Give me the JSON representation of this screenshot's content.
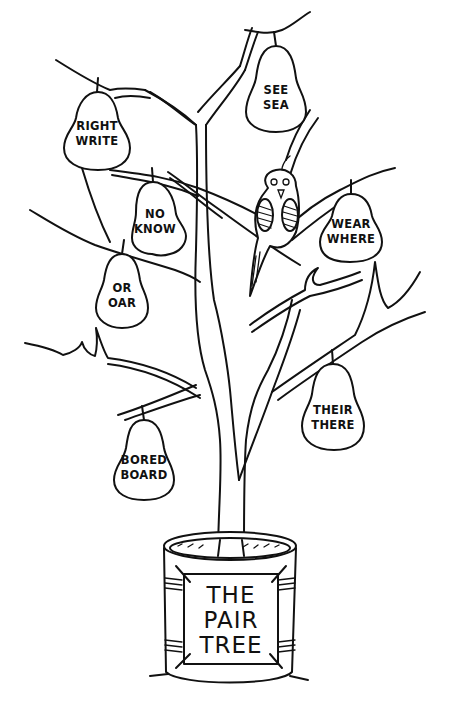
{
  "illustration": {
    "title": "THE PAIR TREE",
    "sign": {
      "lines": [
        "THE",
        "PAIR",
        "TREE"
      ]
    },
    "pears": [
      {
        "id": "right-write",
        "words": [
          "RIGHT",
          "WRITE"
        ]
      },
      {
        "id": "see-sea",
        "words": [
          "SEE",
          "SEA"
        ]
      },
      {
        "id": "no-know",
        "words": [
          "NO",
          "KNOW"
        ]
      },
      {
        "id": "wear-where",
        "words": [
          "WEAR",
          "WHERE"
        ]
      },
      {
        "id": "or-oar",
        "words": [
          "OR",
          "OAR"
        ]
      },
      {
        "id": "their-there",
        "words": [
          "THEIR",
          "THERE"
        ]
      },
      {
        "id": "bored-board",
        "words": [
          "BORED",
          "BOARD"
        ]
      }
    ],
    "characters": [
      {
        "id": "quail",
        "label": "quail perched on branch"
      }
    ],
    "colors": {
      "ink": "#111111",
      "paper": "#ffffff"
    }
  }
}
